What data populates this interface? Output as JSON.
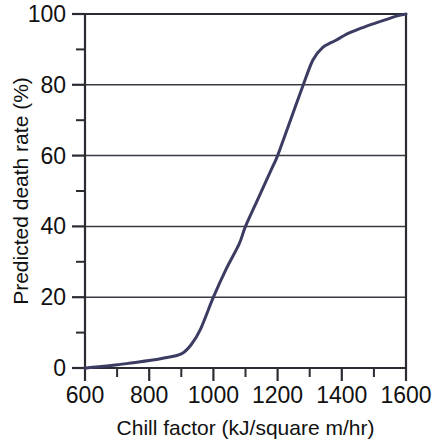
{
  "chart_data": {
    "type": "line",
    "title": "",
    "xlabel": "Chill factor (kJ/square m/hr)",
    "ylabel": "Predicted death rate (%)",
    "xlim": [
      600,
      1600
    ],
    "ylim": [
      0,
      100
    ],
    "grid": true,
    "legend": null,
    "line_color": "#3c3c63",
    "x_ticks_major": [
      600,
      800,
      1000,
      1200,
      1400,
      1600
    ],
    "x_ticks_minor": [
      700,
      900,
      1100,
      1300,
      1500
    ],
    "y_ticks_major": [
      0,
      20,
      40,
      60,
      80,
      100
    ],
    "y_ticks_minor": [
      10,
      30,
      50,
      70,
      90
    ],
    "x_tick_labels": [
      "600",
      "800",
      "1000",
      "1200",
      "1400",
      "1600"
    ],
    "y_tick_labels": [
      "0",
      "20",
      "40",
      "60",
      "80",
      "100"
    ],
    "series": [
      {
        "name": "Predicted death rate",
        "x": [
          600,
          650,
          700,
          750,
          800,
          850,
          900,
          930,
          960,
          1000,
          1040,
          1080,
          1100,
          1140,
          1180,
          1200,
          1240,
          1280,
          1310,
          1340,
          1380,
          1420,
          1460,
          1500,
          1540,
          1570,
          1600
        ],
        "y": [
          0,
          0.4,
          0.9,
          1.5,
          2.1,
          2.9,
          4.0,
          6.5,
          11,
          20,
          28,
          35,
          40,
          48,
          56,
          60,
          70,
          80,
          87,
          90.5,
          92.5,
          94.5,
          96,
          97.3,
          98.5,
          99.4,
          100
        ]
      }
    ],
    "annotations": []
  },
  "layout": {
    "plot_left_px": 85,
    "plot_right_px": 406,
    "plot_top_px": 14,
    "plot_bottom_px": 368
  }
}
